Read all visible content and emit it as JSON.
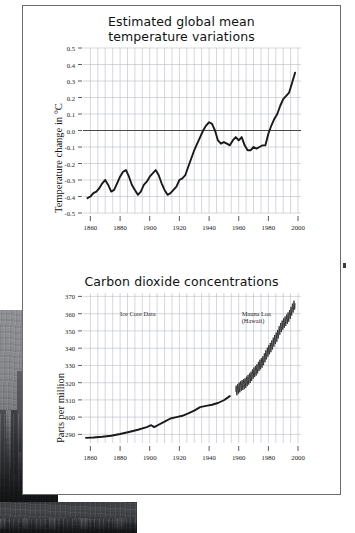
{
  "page": {
    "background_color": "#ffffff",
    "panel_border_color": "#6b6b6b"
  },
  "photo": {
    "name": "grayscale city skyline photograph",
    "description": "Dark grayscale photograph of a hazy city skyline occupying the lower-left corner behind the chart panel"
  },
  "chart_data": [
    {
      "id": "temperature",
      "type": "line",
      "title": "Estimated global mean\ntemperature variations",
      "title_line1": "Estimated global mean",
      "title_line2": "temperature variations",
      "xlabel": "",
      "ylabel": "Temperature change in °C",
      "xlim": [
        1855,
        2002
      ],
      "ylim": [
        -0.5,
        0.5
      ],
      "xticks": [
        1860,
        1880,
        1900,
        1920,
        1940,
        1960,
        1980,
        2000
      ],
      "yticks": [
        0.5,
        0.4,
        0.3,
        0.2,
        0.1,
        0.0,
        -0.1,
        -0.2,
        -0.3,
        -0.4,
        -0.5
      ],
      "ytick_labels": [
        "0.5",
        "0.4",
        "0.3",
        "0.2",
        "0.1",
        "0.0",
        "-0.1",
        "-0.2",
        "-0.3",
        "-0.4",
        "-0.5"
      ],
      "grid": true,
      "grid_color": "#b9bcc4",
      "zero_line": 0.0,
      "line_color": "#1a1a1a",
      "legend": [],
      "annotations": [],
      "x": [
        1858,
        1860,
        1862,
        1864,
        1866,
        1868,
        1870,
        1872,
        1874,
        1876,
        1878,
        1880,
        1882,
        1884,
        1886,
        1888,
        1890,
        1892,
        1894,
        1896,
        1898,
        1900,
        1902,
        1904,
        1906,
        1908,
        1910,
        1912,
        1914,
        1916,
        1918,
        1920,
        1922,
        1924,
        1926,
        1928,
        1930,
        1932,
        1934,
        1936,
        1938,
        1940,
        1942,
        1944,
        1946,
        1948,
        1950,
        1952,
        1954,
        1956,
        1958,
        1960,
        1962,
        1964,
        1966,
        1968,
        1970,
        1972,
        1974,
        1976,
        1978,
        1980,
        1982,
        1984,
        1986,
        1988,
        1990,
        1992,
        1994,
        1996,
        1998
      ],
      "values": [
        -0.41,
        -0.4,
        -0.38,
        -0.37,
        -0.35,
        -0.32,
        -0.3,
        -0.33,
        -0.37,
        -0.36,
        -0.32,
        -0.28,
        -0.25,
        -0.24,
        -0.28,
        -0.33,
        -0.36,
        -0.39,
        -0.37,
        -0.33,
        -0.31,
        -0.28,
        -0.26,
        -0.24,
        -0.27,
        -0.32,
        -0.36,
        -0.39,
        -0.38,
        -0.36,
        -0.34,
        -0.3,
        -0.29,
        -0.27,
        -0.22,
        -0.17,
        -0.12,
        -0.08,
        -0.04,
        0.0,
        0.03,
        0.05,
        0.04,
        0.0,
        -0.06,
        -0.08,
        -0.07,
        -0.08,
        -0.09,
        -0.06,
        -0.04,
        -0.06,
        -0.04,
        -0.09,
        -0.12,
        -0.12,
        -0.1,
        -0.11,
        -0.1,
        -0.09,
        -0.09,
        -0.02,
        0.03,
        0.07,
        0.1,
        0.15,
        0.19,
        0.21,
        0.23,
        0.29,
        0.35
      ]
    },
    {
      "id": "co2",
      "type": "line",
      "title": "Carbon dioxide concentrations",
      "xlabel": "",
      "ylabel": "Parts per million",
      "xlim": [
        1855,
        2002
      ],
      "ylim": [
        285,
        372
      ],
      "xticks": [
        1860,
        1880,
        1900,
        1920,
        1940,
        1960,
        1980,
        2000
      ],
      "yticks": [
        370,
        360,
        350,
        340,
        330,
        320,
        310,
        300,
        290
      ],
      "ytick_labels": [
        "370",
        "360",
        "350",
        "340",
        "330",
        "320",
        "310",
        "300",
        "290"
      ],
      "grid": true,
      "grid_color": "#b9bcc4",
      "line_color": "#1a1a1a",
      "annotations": [
        {
          "text": "Ice Core Data",
          "x": 1880,
          "y": 360
        },
        {
          "text": "Mauna Loa\n(Hawaii)",
          "x": 1962,
          "y": 360
        }
      ],
      "series": [
        {
          "name": "Ice Core Data",
          "x": [
            1857,
            1862,
            1868,
            1874,
            1880,
            1886,
            1892,
            1898,
            1901,
            1903,
            1906,
            1910,
            1914,
            1918,
            1922,
            1926,
            1930,
            1934,
            1938,
            1942,
            1946,
            1950,
            1954
          ],
          "values": [
            288.0,
            288.2,
            288.6,
            289.2,
            290.2,
            291.4,
            292.7,
            294.2,
            295.3,
            294.2,
            295.6,
            297.4,
            299.2,
            300.0,
            300.8,
            302.2,
            303.8,
            305.8,
            306.5,
            307.2,
            308.2,
            309.8,
            312.2
          ]
        },
        {
          "name": "Mauna Loa (Hawaii)",
          "x": [
            1958,
            1960,
            1962,
            1964,
            1966,
            1968,
            1970,
            1972,
            1974,
            1976,
            1978,
            1980,
            1982,
            1984,
            1986,
            1988,
            1990,
            1992,
            1994,
            1996,
            1998
          ],
          "values": [
            315.0,
            316.8,
            318.4,
            319.3,
            321.2,
            323.0,
            325.6,
            327.3,
            330.1,
            331.9,
            335.3,
            338.5,
            341.0,
            344.3,
            347.1,
            351.3,
            354.0,
            356.2,
            358.6,
            362.4,
            365.8
          ],
          "seasonal_amplitude_ppm": 3.0,
          "note": "annual sawtooth oscillation rendered as dense zig-zag"
        }
      ]
    }
  ]
}
